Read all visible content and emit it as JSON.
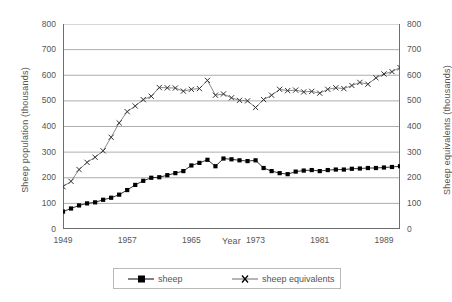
{
  "chart_data": {
    "type": "line",
    "title": "",
    "xlabel": "Year",
    "ylabel": "Sheep population (thousands)",
    "ylabel_right": "Sheep equivalents (thousands)",
    "xlim": [
      1949,
      1991
    ],
    "ylim": [
      0,
      800
    ],
    "ylim_right": [
      0,
      800
    ],
    "yticks": [
      0,
      100,
      200,
      300,
      400,
      500,
      600,
      700,
      800
    ],
    "yticks_right": [
      0,
      100,
      200,
      300,
      400,
      500,
      600,
      700,
      800
    ],
    "xticks_labeled": [
      1949,
      1957,
      1965,
      1973,
      1981,
      1989
    ],
    "xtick_interval": 1,
    "grid": "horizontal",
    "legend_position": "bottom",
    "x": [
      1949,
      1950,
      1951,
      1952,
      1953,
      1954,
      1955,
      1956,
      1957,
      1958,
      1959,
      1960,
      1961,
      1962,
      1963,
      1964,
      1965,
      1966,
      1967,
      1968,
      1969,
      1970,
      1971,
      1972,
      1973,
      1974,
      1975,
      1976,
      1977,
      1978,
      1979,
      1980,
      1981,
      1982,
      1983,
      1984,
      1985,
      1986,
      1987,
      1988,
      1989,
      1990,
      1991
    ],
    "series": [
      {
        "name": "sheep",
        "marker": "square",
        "color": "#000000",
        "values": [
          68,
          80,
          92,
          100,
          104,
          114,
          122,
          134,
          152,
          172,
          188,
          200,
          202,
          210,
          218,
          226,
          248,
          258,
          270,
          245,
          275,
          272,
          268,
          265,
          268,
          238,
          226,
          218,
          214,
          224,
          228,
          230,
          226,
          230,
          232,
          232,
          235,
          236,
          238,
          238,
          240,
          242,
          245
        ]
      },
      {
        "name": "sheep equivalents",
        "marker": "x",
        "color": "#6b6b6b",
        "values": [
          165,
          186,
          232,
          260,
          280,
          305,
          358,
          414,
          458,
          480,
          505,
          518,
          552,
          551,
          550,
          538,
          545,
          548,
          580,
          522,
          527,
          512,
          502,
          500,
          474,
          505,
          522,
          545,
          540,
          542,
          535,
          537,
          530,
          545,
          551,
          548,
          560,
          572,
          565,
          590,
          605,
          614,
          630
        ]
      }
    ]
  },
  "axes": {
    "left_title": "Sheep population (thousands)",
    "right_title": "Sheep equivalents (thousands)",
    "x_title": "Year",
    "y_tick_labels": [
      "800",
      "700",
      "600",
      "500",
      "400",
      "300",
      "200",
      "100",
      "0"
    ],
    "y_tick_labels_right": [
      "800",
      "700",
      "600",
      "500",
      "400",
      "300",
      "200",
      "100",
      "0"
    ],
    "x_tick_labels": [
      "1949",
      "1957",
      "1965",
      "1973",
      "1981",
      "1989"
    ]
  },
  "legend": {
    "items": [
      {
        "label": "sheep",
        "marker": "square"
      },
      {
        "label": "sheep equivalents",
        "marker": "x"
      }
    ]
  },
  "style": {
    "grid_color": "#8a8a8a",
    "axis_color": "#6e6e6e",
    "sheep_color": "#000000",
    "equivalents_color": "#6b6b6b",
    "text_color": "#555555"
  }
}
